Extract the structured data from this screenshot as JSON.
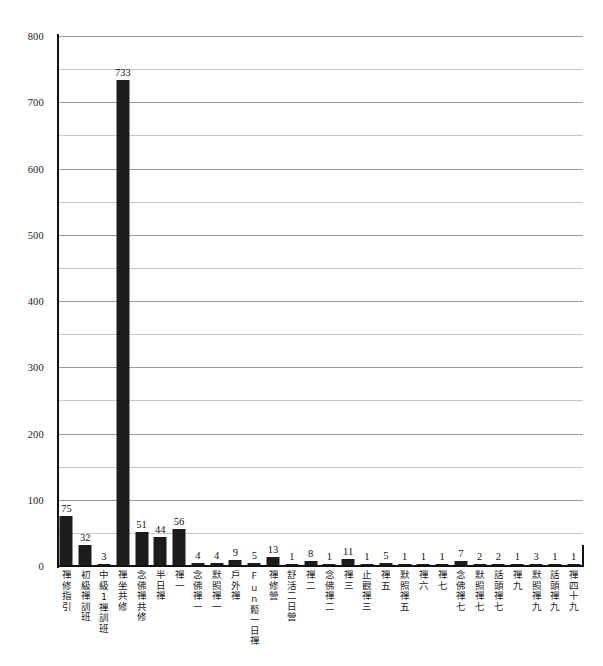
{
  "chart_data": {
    "type": "bar",
    "title": "",
    "subtitle": "",
    "xlabel": "",
    "ylabel": "",
    "ylim": [
      0,
      800
    ],
    "ytick_labels": [
      "0",
      "100",
      "200",
      "300",
      "400",
      "500",
      "600",
      "700",
      "800"
    ],
    "ytick_values": [
      0,
      100,
      200,
      300,
      400,
      500,
      600,
      700,
      800
    ],
    "minor_gridline_step": 50,
    "grid": true,
    "legend": false,
    "legend_position": "none",
    "bar_color": "#1c1c1c",
    "categories": [
      "禪修指引",
      "初級禪訓班",
      "中級1禪訓班",
      "禪坐共修",
      "念佛禪共修",
      "半日禪",
      "禪一",
      "念佛禪一",
      "默照禪一",
      "戶外禪",
      "Fun鬆一日禪",
      "禪修營",
      "舒活二日營",
      "禪二",
      "念佛禪二",
      "禪三",
      "止觀禪三",
      "禪五",
      "默照禪五",
      "禪六",
      "禪七",
      "念佛禪七",
      "默照禪七",
      "話頭禪七",
      "禪九",
      "默照禪九",
      "話頭禪九",
      "禪四十九"
    ],
    "values": [
      75,
      32,
      3,
      733,
      51,
      44,
      56,
      4,
      4,
      9,
      5,
      13,
      1,
      8,
      1,
      11,
      1,
      5,
      1,
      1,
      1,
      7,
      2,
      2,
      1,
      3,
      1,
      1
    ],
    "value_labels": [
      "75",
      "32",
      "3",
      "733",
      "51",
      "44",
      "56",
      "4",
      "4",
      "9",
      "5",
      "13",
      "1",
      "8",
      "1",
      "11",
      "1",
      "5",
      "1",
      "1",
      "1",
      "7",
      "2",
      "2",
      "1",
      "3",
      "1",
      "1"
    ]
  }
}
